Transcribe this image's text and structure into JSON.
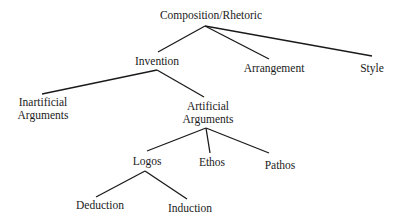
{
  "diagram": {
    "type": "tree",
    "nodes": {
      "root": {
        "label": "Composition/Rhetoric"
      },
      "invention": {
        "label": "Invention"
      },
      "arrangement": {
        "label": "Arrangement"
      },
      "style": {
        "label": "Style"
      },
      "inartificial": {
        "line1": "Inartificial",
        "line2": "Arguments"
      },
      "artificial": {
        "line1": "Artificial",
        "line2": "Arguments"
      },
      "logos": {
        "label": "Logos"
      },
      "ethos": {
        "label": "Ethos"
      },
      "pathos": {
        "label": "Pathos"
      },
      "deduction": {
        "label": "Deduction"
      },
      "induction": {
        "label": "Induction"
      }
    },
    "edges": [
      [
        "Composition/Rhetoric",
        "Invention"
      ],
      [
        "Composition/Rhetoric",
        "Arrangement"
      ],
      [
        "Composition/Rhetoric",
        "Style"
      ],
      [
        "Invention",
        "Inartificial Arguments"
      ],
      [
        "Invention",
        "Artificial Arguments"
      ],
      [
        "Artificial Arguments",
        "Logos"
      ],
      [
        "Artificial Arguments",
        "Ethos"
      ],
      [
        "Artificial Arguments",
        "Pathos"
      ],
      [
        "Logos",
        "Deduction"
      ],
      [
        "Logos",
        "Induction"
      ]
    ],
    "line_color": "#1a1a1a"
  }
}
